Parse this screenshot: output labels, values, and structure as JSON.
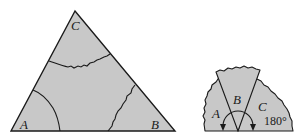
{
  "diagram": {
    "colors": {
      "fill": "#c8c8c8",
      "stroke": "#1a1a1a",
      "background": "#ffffff"
    },
    "triangle": {
      "vertices": {
        "A": {
          "label": "A"
        },
        "B": {
          "label": "B"
        },
        "C": {
          "label": "C"
        }
      }
    },
    "semicircle": {
      "wedges": [
        {
          "label": "A"
        },
        {
          "label": "B"
        },
        {
          "label": "C"
        }
      ],
      "angle_label": "180°"
    }
  }
}
